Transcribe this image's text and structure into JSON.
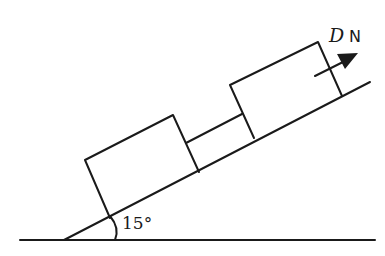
{
  "diagram": {
    "incline_angle_label": "15°",
    "force": {
      "symbol": "D",
      "unit": "N",
      "direction": "up the slope"
    },
    "objects": [
      {
        "name": "lower block"
      },
      {
        "name": "connecting rod"
      },
      {
        "name": "upper block"
      }
    ]
  }
}
